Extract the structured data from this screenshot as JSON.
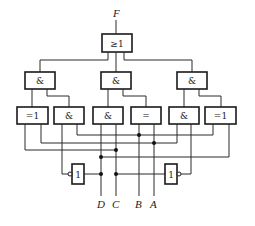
{
  "diagram": {
    "output_label": "F",
    "or_gate": {
      "symbol": "≥1"
    },
    "and_gates_row2": [
      {
        "symbol": "&"
      },
      {
        "symbol": "&"
      },
      {
        "symbol": "&"
      }
    ],
    "row3_gates": [
      {
        "symbol": "=1"
      },
      {
        "symbol": "&"
      },
      {
        "symbol": "&"
      },
      {
        "symbol": "="
      },
      {
        "symbol": "&"
      },
      {
        "symbol": "=1"
      }
    ],
    "inverters": [
      {
        "symbol": "1"
      },
      {
        "symbol": "1"
      }
    ],
    "inputs": [
      {
        "label": "D"
      },
      {
        "label": "C"
      },
      {
        "label": "B"
      },
      {
        "label": "A"
      }
    ],
    "colors": {
      "line": "#1a1a1a",
      "background": "#ffffff"
    }
  }
}
